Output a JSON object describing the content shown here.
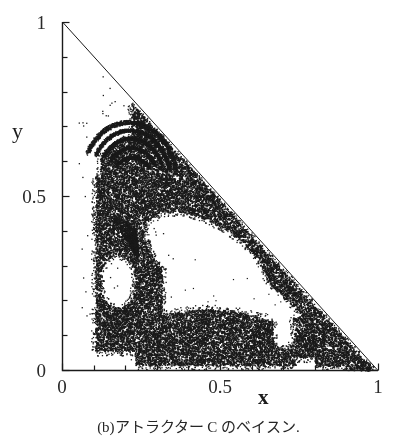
{
  "figure": {
    "caption": "(b)アトラクター C のベイスン.",
    "background_color": "#ffffff",
    "ink_color": "#1a1a1a"
  },
  "axes": {
    "x_title": "x",
    "y_title": "y",
    "x_tick_labels": [
      "0",
      "0.5",
      "1"
    ],
    "y_tick_labels": [
      "1",
      "0.5",
      "0"
    ],
    "x_label_0": "0",
    "x_label_half": "0.5",
    "x_label_1": "1",
    "y_label_0": "0",
    "y_label_half": "0.5",
    "y_label_1": "1"
  },
  "chart_data": {
    "type": "scatter",
    "title": "",
    "subtitle": "",
    "xlabel": "x",
    "ylabel": "y",
    "xlim": [
      0,
      1
    ],
    "ylim": [
      0,
      1
    ],
    "grid": false,
    "legend": null,
    "x_ticks": [
      0,
      0.1,
      0.2,
      0.3,
      0.4,
      0.5,
      0.6,
      0.7,
      0.8,
      0.9,
      1
    ],
    "y_ticks": [
      0,
      0.1,
      0.2,
      0.3,
      0.4,
      0.5,
      0.6,
      0.7,
      0.8,
      0.9,
      1
    ],
    "x_major_ticks": [
      0,
      0.5,
      1
    ],
    "y_major_ticks": [
      0,
      0.5,
      1
    ],
    "x_tick_labels": [
      "0",
      "0.5",
      "1"
    ],
    "y_tick_labels": [
      "0",
      "0.5",
      "1"
    ],
    "domain_constraint": "x >= 0, y >= 0, x + y <= 1",
    "domain_shape": "simplex-triangle",
    "point_color": "#1a1a1a",
    "point_size_px": 1.6,
    "approx_point_count": 16000,
    "regions": [
      {
        "name": "upper-left-spiral-filaments",
        "x_range": [
          0.07,
          0.28
        ],
        "y_range": [
          0.55,
          0.78
        ],
        "density": "sparse"
      },
      {
        "name": "upper-dense-lobe",
        "x_range": [
          0.13,
          0.45
        ],
        "y_range": [
          0.4,
          0.65
        ],
        "density": "dense"
      },
      {
        "name": "hypotenuse-band",
        "x_range": [
          0.3,
          0.95
        ],
        "y_range": [
          0.03,
          0.6
        ],
        "density": "dense"
      },
      {
        "name": "left-column",
        "x_range": [
          0.1,
          0.3
        ],
        "y_range": [
          0.08,
          0.5
        ],
        "density": "dense"
      },
      {
        "name": "lower-arc-band",
        "x_range": [
          0.25,
          0.72
        ],
        "y_range": [
          0.02,
          0.2
        ],
        "density": "dense"
      },
      {
        "name": "isolated-blob",
        "x_range": [
          0.7,
          0.83
        ],
        "y_range": [
          0.05,
          0.16
        ],
        "density": "dense"
      },
      {
        "name": "central-white-hole",
        "x_range": [
          0.28,
          0.68
        ],
        "y_range": [
          0.18,
          0.45
        ],
        "density": "empty"
      }
    ]
  }
}
